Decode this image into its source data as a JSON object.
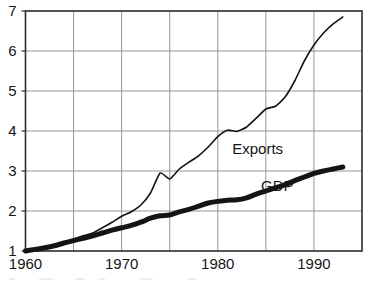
{
  "chart_data": {
    "type": "line",
    "title": "",
    "subtitle": "",
    "xlabel": "",
    "ylabel": "",
    "xlim": [
      1960,
      1995
    ],
    "ylim": [
      1,
      7
    ],
    "yticks": [
      1,
      2,
      3,
      4,
      5,
      6,
      7
    ],
    "ytick_labels": [
      "1",
      "2",
      "3",
      "4",
      "5",
      "6",
      "7"
    ],
    "xticks": [
      1960,
      1965,
      1970,
      1975,
      1980,
      1985,
      1990,
      1995
    ],
    "xtick_labels": [
      "1960",
      "",
      "1970",
      "",
      "1980",
      "",
      "1990",
      ""
    ],
    "xtick_labels_shown": [
      "1960",
      "1970",
      "1980",
      "1990"
    ],
    "grid": true,
    "grid_color": "#8a8a8a",
    "legend": "inline-annotations",
    "note": "Index, 1960 = 1. Both series normalised to 1 in 1960.",
    "series": [
      {
        "name": "Exports",
        "style": "thin",
        "color": "#141414",
        "line_width": 1.6,
        "label_x": 1981.5,
        "label_y": 3.55,
        "x": [
          1960,
          1961,
          1962,
          1963,
          1964,
          1965,
          1966,
          1967,
          1968,
          1969,
          1970,
          1971,
          1972,
          1973,
          1974,
          1975,
          1976,
          1977,
          1978,
          1979,
          1980,
          1981,
          1982,
          1983,
          1984,
          1985,
          1986,
          1987,
          1988,
          1989,
          1990,
          1991,
          1992,
          1993
        ],
        "values": [
          1.0,
          1.04,
          1.09,
          1.15,
          1.23,
          1.3,
          1.38,
          1.45,
          1.58,
          1.72,
          1.87,
          1.98,
          2.15,
          2.45,
          2.95,
          2.8,
          3.05,
          3.22,
          3.38,
          3.6,
          3.86,
          4.02,
          3.99,
          4.1,
          4.32,
          4.55,
          4.62,
          4.85,
          5.25,
          5.75,
          6.15,
          6.45,
          6.68,
          6.85
        ]
      },
      {
        "name": "GDP",
        "style": "thick",
        "color": "#141414",
        "line_width": 5.0,
        "label_x": 1984.5,
        "label_y": 2.62,
        "x": [
          1960,
          1961,
          1962,
          1963,
          1964,
          1965,
          1966,
          1967,
          1968,
          1969,
          1970,
          1971,
          1972,
          1973,
          1974,
          1975,
          1976,
          1977,
          1978,
          1979,
          1980,
          1981,
          1982,
          1983,
          1984,
          1985,
          1986,
          1987,
          1988,
          1989,
          1990,
          1991,
          1992,
          1993
        ],
        "values": [
          1.0,
          1.04,
          1.08,
          1.13,
          1.2,
          1.26,
          1.32,
          1.38,
          1.45,
          1.52,
          1.58,
          1.64,
          1.72,
          1.82,
          1.88,
          1.9,
          1.98,
          2.04,
          2.12,
          2.2,
          2.24,
          2.27,
          2.28,
          2.33,
          2.42,
          2.5,
          2.58,
          2.66,
          2.76,
          2.85,
          2.94,
          3.0,
          3.05,
          3.1
        ]
      }
    ]
  },
  "axes": {
    "frame_color": "#2b2b2b",
    "background": "#ffffff"
  }
}
